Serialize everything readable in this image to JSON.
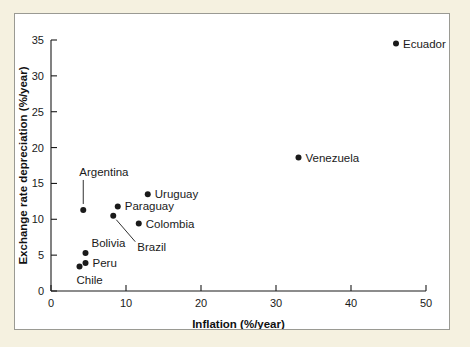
{
  "figure": {
    "panel_background": "#ffffff",
    "page_background": "#f5f1e0",
    "border_color": "#9a9a93",
    "marker_color": "#1a1a1a"
  },
  "chart_data": {
    "type": "scatter",
    "title": "",
    "xlabel": "Inflation (%/year)",
    "ylabel": "Exchange rate depreciation (%/year)",
    "xlim": [
      0,
      50
    ],
    "ylim": [
      0,
      35
    ],
    "xticks": [
      0,
      10,
      20,
      30,
      40,
      50
    ],
    "yticks": [
      0,
      5,
      10,
      15,
      20,
      25,
      30,
      35
    ],
    "xtick_labels": [
      "0",
      "10",
      "20",
      "30",
      "40",
      "50"
    ],
    "ytick_labels": [
      "0",
      "5",
      "10",
      "15",
      "20",
      "25",
      "30",
      "35"
    ],
    "grid": false,
    "legend": false,
    "points": [
      {
        "name": "Ecuador",
        "x": 46.0,
        "y": 34.5,
        "label_position": "right",
        "leader": "none"
      },
      {
        "name": "Venezuela",
        "x": 33.0,
        "y": 18.6,
        "label_position": "right",
        "leader": "none"
      },
      {
        "name": "Uruguay",
        "x": 12.9,
        "y": 13.5,
        "label_position": "right",
        "leader": "none"
      },
      {
        "name": "Paraguay",
        "x": 8.9,
        "y": 11.8,
        "label_position": "right",
        "leader": "none"
      },
      {
        "name": "Colombia",
        "x": 11.7,
        "y": 9.4,
        "label_position": "right",
        "leader": "none"
      },
      {
        "name": "Argentina",
        "x": 4.3,
        "y": 11.3,
        "label_position": "above",
        "leader": "vertical"
      },
      {
        "name": "Brazil",
        "x": 8.3,
        "y": 10.5,
        "label_position": "below-right",
        "leader": "diagonal"
      },
      {
        "name": "Bolivia",
        "x": 4.6,
        "y": 5.3,
        "label_position": "above-right",
        "leader": "none"
      },
      {
        "name": "Peru",
        "x": 4.6,
        "y": 3.9,
        "label_position": "right",
        "leader": "none"
      },
      {
        "name": "Chile",
        "x": 3.8,
        "y": 3.4,
        "label_position": "below",
        "leader": "none"
      }
    ]
  }
}
